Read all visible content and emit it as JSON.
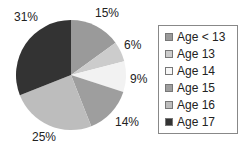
{
  "chart_data": {
    "type": "pie",
    "title": "",
    "categories": [
      "Age < 13",
      "Age 13",
      "Age 14",
      "Age 15",
      "Age 16",
      "Age 17"
    ],
    "values": [
      15,
      6,
      9,
      14,
      25,
      31
    ],
    "labels": [
      "15%",
      "6%",
      "9%",
      "14%",
      "25%",
      "31%"
    ],
    "colors": [
      "#9a9a9a",
      "#cccccc",
      "#f2f2f2",
      "#9e9e9e",
      "#bdbdbd",
      "#333333"
    ],
    "start_angle": "12 o'clock",
    "direction": "clockwise",
    "legend_position": "right"
  },
  "legend": {
    "items": [
      "Age < 13",
      "Age 13",
      "Age 14",
      "Age 15",
      "Age 16",
      "Age 17"
    ]
  }
}
